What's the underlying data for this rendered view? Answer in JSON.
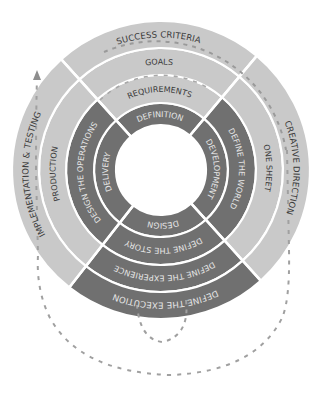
{
  "diagram": {
    "center": [
      161,
      170
    ],
    "radii": [
      45,
      67,
      95,
      122,
      149
    ],
    "colors": {
      "light": "#c9c9c9",
      "dark": "#707070",
      "divider": "#ffffff",
      "dash": "#9a9a9a",
      "text_on_light": "#3a3a3a",
      "text_on_dark": "#e6e6e6"
    },
    "sectors": [
      {
        "name": "top",
        "start_deg": -42,
        "end_deg": 40,
        "rings": [
          {
            "label": "DEFINITION",
            "shade": "dark"
          },
          {
            "label": "REQUIREMENTS",
            "shade": "light"
          },
          {
            "label": "GOALS",
            "shade": "light"
          },
          {
            "label": "SUCCESS CRITERIA",
            "shade": "light"
          }
        ]
      },
      {
        "name": "right",
        "start_deg": 40,
        "end_deg": 138,
        "rings": [
          {
            "label": "DEVELOPMENT",
            "shade": "dark"
          },
          {
            "label": "DEFINE THE WORLD",
            "shade": "dark"
          },
          {
            "label": "ONE SHEET",
            "shade": "light"
          },
          {
            "label": "CREATIVE DIRECTION",
            "shade": "light"
          }
        ]
      },
      {
        "name": "bottom",
        "start_deg": 138,
        "end_deg": 218,
        "rings": [
          {
            "label": "DESIGN",
            "shade": "dark"
          },
          {
            "label": "DEFINE THE STORY",
            "shade": "dark"
          },
          {
            "label": "DEFINE THE EXPERIENCE",
            "shade": "dark"
          },
          {
            "label": "DEFINE THE EXECUTION",
            "shade": "dark"
          }
        ]
      },
      {
        "name": "left",
        "start_deg": 218,
        "end_deg": 318,
        "rings": [
          {
            "label": "DELIVERY",
            "shade": "dark"
          },
          {
            "label": "DESIGN THE OPERATIONS",
            "shade": "dark"
          },
          {
            "label": "PRODUCTION",
            "shade": "light"
          },
          {
            "label": "IMPLEMENTATION & TESTING",
            "shade": "light"
          }
        ]
      }
    ]
  }
}
